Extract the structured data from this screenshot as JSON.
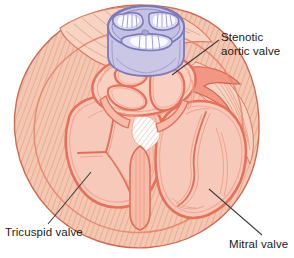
{
  "figure": {
    "title_visible": false,
    "kind": "anatomical-illustration",
    "colors": {
      "background": "#ffffff",
      "myocardium_fill": "#f3c7b2",
      "myocardium_hatch": "#e08d72",
      "chamber_fill": "#f7c9ba",
      "valve_ring_fill": "#f9cfc2",
      "outline_pink": "#ea7b66",
      "outline_dark": "#d4604c",
      "aortic_valve_fill": "#c9c6e6",
      "aortic_valve_outline": "#7c79bb",
      "aortic_valve_highlight": "#ffffff",
      "leader_line": "#3c3c3c",
      "label_text": "#1a1a1a"
    },
    "labels": [
      {
        "name": "stenotic-aortic-valve",
        "text": "Stenotic\naortic valve",
        "leader_from": [
          219,
          40
        ],
        "leader_to": [
          172,
          74
        ]
      },
      {
        "name": "tricuspid-valve",
        "text": "Tricuspid valve",
        "leader_from": [
          48,
          224
        ],
        "leader_to": [
          90,
          172
        ]
      },
      {
        "name": "mitral-valve",
        "text": "Mitral valve",
        "leader_from": [
          262,
          235
        ],
        "leader_to": [
          210,
          189
        ]
      }
    ]
  }
}
